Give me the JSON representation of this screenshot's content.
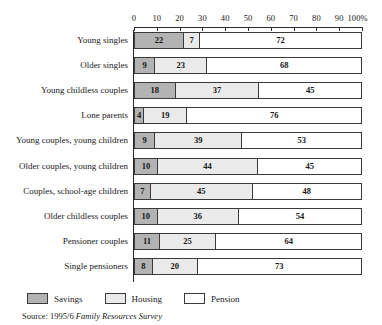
{
  "chart_data": {
    "type": "bar",
    "orientation": "horizontal",
    "stacked": true,
    "stacked_percent": true,
    "title": "",
    "subtitle": "",
    "xlabel": "",
    "ylabel": "",
    "xlim": [
      0,
      100
    ],
    "grid": false,
    "legend_position": "bottom-left",
    "axis_ticks": [
      {
        "value": 0,
        "label": "0"
      },
      {
        "value": 10,
        "label": "10"
      },
      {
        "value": 20,
        "label": "20"
      },
      {
        "value": 30,
        "label": "30"
      },
      {
        "value": 40,
        "label": "40"
      },
      {
        "value": 50,
        "label": "50"
      },
      {
        "value": 60,
        "label": "60"
      },
      {
        "value": 70,
        "label": "70"
      },
      {
        "value": 80,
        "label": "80"
      },
      {
        "value": 90,
        "label": "90"
      },
      {
        "value": 100,
        "label": "100%"
      }
    ],
    "categories": [
      "Young singles",
      "Older singles",
      "Young childless couples",
      "Lone parents",
      "Young couples, young children",
      "Older couples, young children",
      "Couples, school-age children",
      "Older childless couples",
      "Pensioner couples",
      "Single pensioners"
    ],
    "series": [
      {
        "name": "Savings",
        "color": "#b3b3b3",
        "values": [
          22,
          9,
          18,
          4,
          9,
          10,
          7,
          10,
          11,
          8
        ]
      },
      {
        "name": "Housing",
        "color": "#eaeaea",
        "values": [
          7,
          23,
          37,
          19,
          39,
          44,
          45,
          36,
          25,
          20
        ]
      },
      {
        "name": "Pension",
        "color": "#ffffff",
        "values": [
          72,
          68,
          45,
          76,
          53,
          45,
          48,
          54,
          64,
          73
        ]
      }
    ],
    "rows": [
      {
        "category": "Young singles",
        "savings": 22,
        "housing": 7,
        "pension": 72
      },
      {
        "category": "Older singles",
        "savings": 9,
        "housing": 23,
        "pension": 68
      },
      {
        "category": "Young childless couples",
        "savings": 18,
        "housing": 37,
        "pension": 45
      },
      {
        "category": "Lone parents",
        "savings": 4,
        "housing": 19,
        "pension": 76
      },
      {
        "category": "Young couples, young children",
        "savings": 9,
        "housing": 39,
        "pension": 53
      },
      {
        "category": "Older couples, young children",
        "savings": 10,
        "housing": 44,
        "pension": 45
      },
      {
        "category": "Couples, school-age children",
        "savings": 7,
        "housing": 45,
        "pension": 48
      },
      {
        "category": "Older childless couples",
        "savings": 10,
        "housing": 36,
        "pension": 54
      },
      {
        "category": "Pensioner couples",
        "savings": 11,
        "housing": 25,
        "pension": 64
      },
      {
        "category": "Single pensioners",
        "savings": 8,
        "housing": 20,
        "pension": 73
      }
    ]
  },
  "legend": {
    "items": [
      {
        "label": "Savings",
        "swatch": "savings"
      },
      {
        "label": "Housing",
        "swatch": "housing"
      },
      {
        "label": "Pension",
        "swatch": "pension"
      }
    ]
  },
  "source": {
    "prefix": "Source: 1995/6 ",
    "italic": "Family Resources Survey"
  },
  "colors": {
    "savings": "#b3b3b3",
    "housing": "#eaeaea",
    "pension": "#ffffff",
    "outline": "#3a3a3a",
    "axis": "#2b2b2b"
  }
}
